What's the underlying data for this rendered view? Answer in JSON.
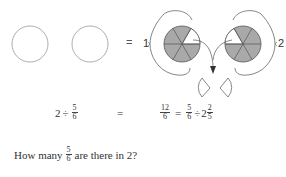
{
  "diagram": {
    "empty_circles": [
      {
        "label": ""
      },
      {
        "label": ""
      }
    ],
    "equals_sign": "=",
    "left_label": "1",
    "right_label": "2",
    "pies": [
      {
        "slices": 6,
        "shaded": 5,
        "unshaded_position": "right"
      },
      {
        "slices": 6,
        "shaded": 5,
        "unshaded_position": "left"
      }
    ],
    "colors": {
      "shaded": "#a9a9a9",
      "stroke": "#555555",
      "empty_circle": "#999999"
    }
  },
  "equation": {
    "lhs": {
      "whole": "2",
      "op": "÷",
      "frac_num": "5",
      "frac_den": "6"
    },
    "equals": "=",
    "rhs": {
      "frac1_num": "12",
      "frac1_den": "6",
      "eq2": "=",
      "frac2_num": "5",
      "frac2_den": "6",
      "op": "÷",
      "mixed_whole": "2",
      "mixed_num": "2",
      "mixed_den": "5"
    }
  },
  "question": {
    "prefix": "How many",
    "frac_num": "5",
    "frac_den": "6",
    "suffix": "are there in 2?"
  }
}
